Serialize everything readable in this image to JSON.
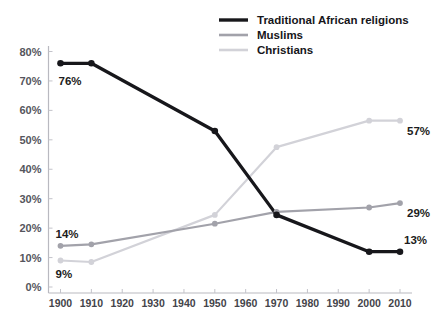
{
  "chart_data": {
    "type": "line",
    "title": "",
    "subtitle": "",
    "xlabel": "",
    "ylabel": "",
    "xlim": [
      1900,
      2010
    ],
    "ylim": [
      0,
      80
    ],
    "grid": false,
    "legend_position": "top-right",
    "x": [
      1900,
      1910,
      1950,
      1970,
      2000,
      2010
    ],
    "xtick_labels": [
      "1900",
      "1910",
      "1920",
      "1930",
      "1940",
      "1950",
      "1960",
      "1970",
      "1980",
      "1990",
      "2000",
      "2010"
    ],
    "xticks": [
      1900,
      1910,
      1920,
      1930,
      1940,
      1950,
      1960,
      1970,
      1980,
      1990,
      2000,
      2010
    ],
    "ytick_labels": [
      "0%",
      "10%",
      "20%",
      "30%",
      "40%",
      "50%",
      "60%",
      "70%",
      "80%"
    ],
    "yticks": [
      0,
      10,
      20,
      30,
      40,
      50,
      60,
      70,
      80
    ],
    "series": [
      {
        "name": "Traditional African religions",
        "color": "#17171b",
        "values": [
          76,
          76,
          53,
          24.5,
          12,
          12
        ],
        "marker": "circle"
      },
      {
        "name": "Muslims",
        "color": "#a2a2aa",
        "values": [
          14,
          14.5,
          21.5,
          25.5,
          27,
          28.5
        ],
        "marker": "circle"
      },
      {
        "name": "Christians",
        "color": "#d2d2d8",
        "values": [
          9,
          8.5,
          24.5,
          47.5,
          56.5,
          56.5
        ],
        "marker": "circle"
      }
    ],
    "annotations": [
      {
        "text": "76%",
        "series": "Traditional African religions",
        "x": 1900,
        "value": 76,
        "position": "below-right"
      },
      {
        "text": "14%",
        "series": "Muslims",
        "x": 1900,
        "value": 14,
        "position": "above-right"
      },
      {
        "text": "9%",
        "series": "Christians",
        "x": 1900,
        "value": 9,
        "position": "below-right"
      },
      {
        "text": "57%",
        "series": "Christians",
        "x": 2010,
        "value": 56.5,
        "position": "below-right"
      },
      {
        "text": "29%",
        "series": "Muslims",
        "x": 2010,
        "value": 28.5,
        "position": "below-right"
      },
      {
        "text": "13%",
        "series": "Traditional African religions",
        "x": 2010,
        "value": 12,
        "position": "above-right"
      }
    ]
  },
  "legend": {
    "entries": [
      {
        "label": "Traditional African religions",
        "color": "#17171b",
        "thickness": 3.4
      },
      {
        "label": "Muslims",
        "color": "#a2a2aa",
        "thickness": 2.6
      },
      {
        "label": "Christians",
        "color": "#d2d2d8",
        "thickness": 2.6
      }
    ]
  }
}
